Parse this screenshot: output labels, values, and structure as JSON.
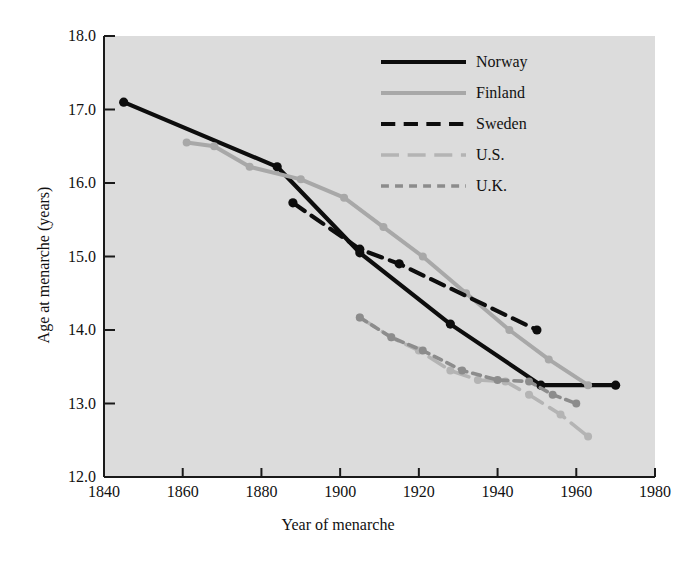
{
  "chart_data": {
    "type": "line",
    "title": "",
    "xlabel": "Year of menarche",
    "ylabel": "Age at menarche (years)",
    "xlim": [
      1840,
      1980
    ],
    "ylim": [
      12.0,
      18.0
    ],
    "xticks": [
      1840,
      1860,
      1880,
      1900,
      1920,
      1940,
      1960,
      1980
    ],
    "xtick_labels": [
      "1840",
      "1860",
      "1880",
      "1900",
      "1920",
      "1940",
      "1960",
      "1980"
    ],
    "yticks": [
      12.0,
      13.0,
      14.0,
      15.0,
      16.0,
      17.0,
      18.0
    ],
    "ytick_labels": [
      "12.0",
      "13.0",
      "14.0",
      "15.0",
      "16.0",
      "17.0",
      "18.0"
    ],
    "grid": false,
    "legend_position": "top-right",
    "plot_background": "#dcdcdc",
    "figure_background": "#ffffff",
    "series": [
      {
        "name": "Norway",
        "color": "#0d0d0d",
        "style": "solid",
        "marker": true,
        "x": [
          1845,
          1884,
          1905,
          1928,
          1951,
          1970
        ],
        "y": [
          17.1,
          16.22,
          15.05,
          14.08,
          13.25,
          13.25
        ]
      },
      {
        "name": "Finland",
        "color": "#a8a8a8",
        "style": "solid",
        "marker": true,
        "x": [
          1861,
          1868,
          1877,
          1890,
          1901,
          1911,
          1921,
          1932,
          1943,
          1953,
          1963
        ],
        "y": [
          16.55,
          16.5,
          16.22,
          16.05,
          15.8,
          15.4,
          15.0,
          14.5,
          14.0,
          13.6,
          13.25
        ]
      },
      {
        "name": "Sweden",
        "color": "#0d0d0d",
        "style": "dashed",
        "marker": true,
        "x": [
          1888,
          1905,
          1915,
          1950
        ],
        "y": [
          15.73,
          15.1,
          14.9,
          14.0
        ]
      },
      {
        "name": "U.S.",
        "color": "#b4b4b4",
        "style": "longdash",
        "marker": true,
        "x": [
          1905,
          1913,
          1920,
          1928,
          1935,
          1942,
          1948,
          1956,
          1963
        ],
        "y": [
          14.17,
          13.9,
          13.72,
          13.45,
          13.32,
          13.3,
          13.12,
          12.85,
          12.55
        ]
      },
      {
        "name": "U.K.",
        "color": "#8c8c8c",
        "style": "shortdash",
        "marker": true,
        "x": [
          1905,
          1913,
          1921,
          1931,
          1940,
          1948,
          1954,
          1960
        ],
        "y": [
          14.17,
          13.9,
          13.72,
          13.45,
          13.32,
          13.3,
          13.12,
          13.0
        ]
      }
    ]
  },
  "legend": {
    "entries": [
      {
        "label": "Norway",
        "color": "#0d0d0d",
        "style": "solid"
      },
      {
        "label": "Finland",
        "color": "#a8a8a8",
        "style": "solid"
      },
      {
        "label": "Sweden",
        "color": "#0d0d0d",
        "style": "dashed"
      },
      {
        "label": "U.S.",
        "color": "#b4b4b4",
        "style": "longdash"
      },
      {
        "label": "U.K.",
        "color": "#8c8c8c",
        "style": "shortdash"
      }
    ]
  },
  "geometry": {
    "plot_left": 104,
    "plot_right": 655,
    "plot_top": 36,
    "plot_bottom": 477
  }
}
